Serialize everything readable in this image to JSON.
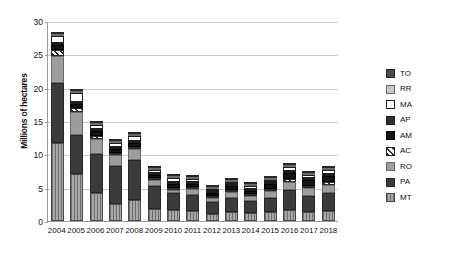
{
  "chart_data": {
    "type": "bar",
    "stacked": true,
    "title": "",
    "subtitle": "",
    "xlabel": "",
    "ylabel": "Millions of hectares",
    "ylim": [
      0,
      30
    ],
    "yticks": [
      0,
      5,
      10,
      15,
      20,
      25,
      30
    ],
    "grid": true,
    "legend_position": "right",
    "legend": [
      "TO",
      "RR",
      "MA",
      "AP",
      "AM",
      "AC",
      "RO",
      "PA",
      "MT"
    ],
    "categories": [
      "2004",
      "2005",
      "2006",
      "2007",
      "2008",
      "2009",
      "2010",
      "2011",
      "2012",
      "2013",
      "2014",
      "2015",
      "2016",
      "2017",
      "2018"
    ],
    "series": [
      {
        "name": "MT",
        "values": [
          11.7,
          7.0,
          4.2,
          2.6,
          3.1,
          1.8,
          1.6,
          1.5,
          1.1,
          1.3,
          1.2,
          1.3,
          1.6,
          1.4,
          1.5
        ]
      },
      {
        "name": "PA",
        "values": [
          9.0,
          5.9,
          5.9,
          5.6,
          6.1,
          3.4,
          2.6,
          2.4,
          1.7,
          2.1,
          1.8,
          2.1,
          3.1,
          2.4,
          2.7
        ]
      },
      {
        "name": "RO",
        "values": [
          4.1,
          3.4,
          2.2,
          1.7,
          1.6,
          1.0,
          0.5,
          0.9,
          0.6,
          0.9,
          0.7,
          1.1,
          1.2,
          1.1,
          1.2
        ]
      },
      {
        "name": "AC",
        "values": [
          0.8,
          0.7,
          0.4,
          0.3,
          0.3,
          0.3,
          0.3,
          0.3,
          0.3,
          0.2,
          0.3,
          0.3,
          0.4,
          0.3,
          0.4
        ]
      },
      {
        "name": "AM",
        "values": [
          0.8,
          0.6,
          0.8,
          0.6,
          0.6,
          0.4,
          0.6,
          0.5,
          0.5,
          0.6,
          0.5,
          0.7,
          0.9,
          0.9,
          1.0
        ]
      },
      {
        "name": "AP",
        "values": [
          0.2,
          0.1,
          0.1,
          0.1,
          0.1,
          0.1,
          0.1,
          0.1,
          0.1,
          0.1,
          0.1,
          0.1,
          0.1,
          0.1,
          0.1
        ]
      },
      {
        "name": "MA",
        "values": [
          1.0,
          1.3,
          0.6,
          0.6,
          0.8,
          0.5,
          0.5,
          0.4,
          0.3,
          0.4,
          0.4,
          0.4,
          0.6,
          0.5,
          0.5
        ]
      },
      {
        "name": "RR",
        "values": [
          0.1,
          0.1,
          0.1,
          0.1,
          0.1,
          0.1,
          0.1,
          0.1,
          0.1,
          0.1,
          0.1,
          0.1,
          0.1,
          0.1,
          0.1
        ]
      },
      {
        "name": "TO",
        "values": [
          0.2,
          0.1,
          0.1,
          0.1,
          0.1,
          0.1,
          0.1,
          0.1,
          0.1,
          0.1,
          0.1,
          0.1,
          0.1,
          0.1,
          0.1
        ]
      }
    ],
    "series_colors": {
      "TO": "#4a4a4a",
      "RR": "#c9c9c9",
      "MA": "#ffffff",
      "AP": "#2e2e2e",
      "AM": "#141414",
      "AC": "#ffffff",
      "RO": "#9d9d9d",
      "PA": "#3b3b3b",
      "MT": "#8e8e8e"
    }
  }
}
